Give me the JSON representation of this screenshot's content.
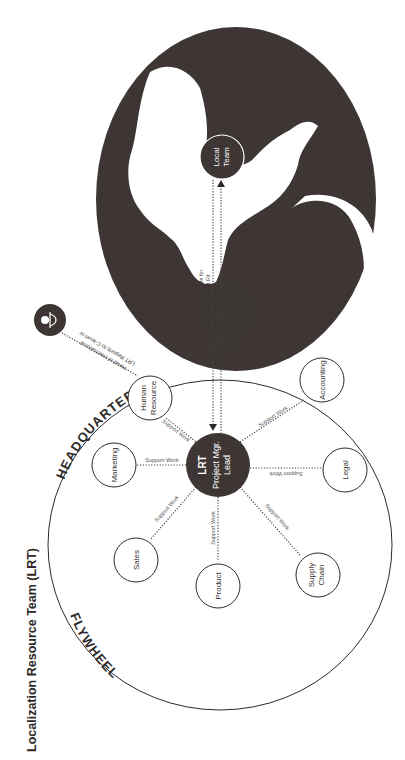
{
  "title": "Localization Resource Team (LRT)",
  "colors": {
    "globe": "#3d3634",
    "lrt_fill": "#3d3634",
    "line": "#2e2a29",
    "background": "#ffffff"
  },
  "globe": {
    "local_team_line1": "Local",
    "local_team_line2": "Team"
  },
  "headquarters": {
    "top_arc_label": "HEADQUARTERS",
    "bottom_arc_label": "FLYWHEEL",
    "center": {
      "line1": "LRT",
      "line2": "Project Mgr.",
      "line3": "Lead"
    },
    "nodes": [
      {
        "id": "human-resource",
        "line1": "Human",
        "line2": "Resource"
      },
      {
        "id": "marketing",
        "line1": "Marketing",
        "line2": ""
      },
      {
        "id": "sales",
        "line1": "Sales",
        "line2": ""
      },
      {
        "id": "product",
        "line1": "Product",
        "line2": ""
      },
      {
        "id": "supply-chain",
        "line1": "Supply",
        "line2": "Chain"
      },
      {
        "id": "legal",
        "line1": "Legal",
        "line2": ""
      },
      {
        "id": "accounting",
        "line1": "Accounting",
        "line2": ""
      }
    ],
    "support_label": "Support Work"
  },
  "connections": {
    "to_hq_line1": "Local Market Insights for",
    "to_hq_line2": "Company-Market Fit",
    "to_local_line1": "Navigate Corporate, Remove",
    "to_local_line2": "Obstacles, and Shepherd",
    "to_local_line3": "Internationalization",
    "to_local_line4": "(Guardrails)"
  },
  "executive": {
    "icon": "person-icon",
    "line1": "LRT Reports to C-level or",
    "line2": "Head of International"
  }
}
